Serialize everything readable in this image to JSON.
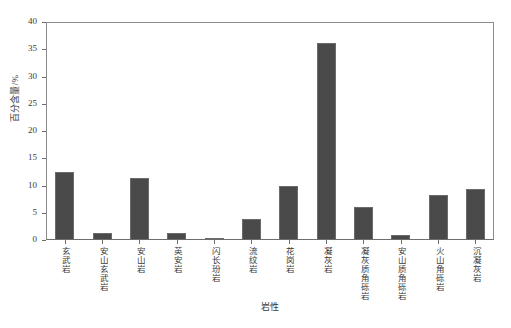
{
  "chart_data": {
    "type": "bar",
    "title": "",
    "xlabel": "岩性",
    "ylabel": "百分含量/%",
    "ylim": [
      0,
      40
    ],
    "yticks": [
      0,
      5,
      10,
      15,
      20,
      25,
      30,
      35,
      40
    ],
    "ytick_labels": [
      "0",
      "5",
      "10",
      "15",
      "20",
      "25",
      "30",
      "35",
      "40"
    ],
    "grid": false,
    "legend": null,
    "bar_color": "#4a4a4a",
    "bar_edge_color": "#6b6b6b",
    "categories": [
      "玄武岩",
      "安山玄武岩",
      "安山岩",
      "英安岩",
      "闪长玢岩",
      "流纹岩",
      "花岗岩",
      "凝灰岩",
      "凝灰质角砾岩",
      "安山质角砾岩",
      "火山角砾岩",
      "沉凝灰岩"
    ],
    "values": [
      12.4,
      1.2,
      11.3,
      1.3,
      0.3,
      3.8,
      10.0,
      36.2,
      6.0,
      1.0,
      8.2,
      9.3
    ]
  }
}
